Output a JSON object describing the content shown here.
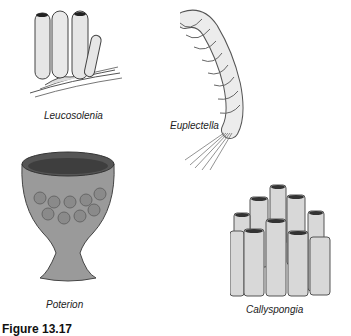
{
  "figure": {
    "caption": "Figure 13.17",
    "specimens": [
      {
        "name": "Leucosolenia"
      },
      {
        "name": "Euplectella"
      },
      {
        "name": "Poterion"
      },
      {
        "name": "Callyspongia"
      }
    ]
  }
}
